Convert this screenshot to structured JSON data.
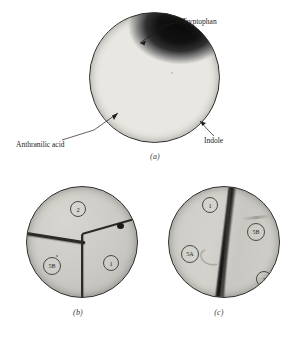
{
  "figure": {
    "panels": [
      {
        "id": "a",
        "caption": "(a)",
        "annotations": [
          {
            "name": "tryptophan",
            "label_prefix": "L",
            "label_rest": "-Tryptophan"
          },
          {
            "name": "anthranilic-acid",
            "label": "Anthranilic acid"
          },
          {
            "name": "indole",
            "label": "Indole"
          }
        ]
      },
      {
        "id": "b",
        "caption": "(b)",
        "tags": [
          {
            "name": "sector-2",
            "text": "2"
          },
          {
            "name": "sector-5b",
            "text": "5B"
          },
          {
            "name": "sector-1",
            "text": "1"
          }
        ]
      },
      {
        "id": "c",
        "caption": "(c)",
        "tags": [
          {
            "name": "sector-1",
            "text": "1"
          },
          {
            "name": "sector-5b",
            "text": "5B"
          },
          {
            "name": "sector-5a",
            "text": "5A"
          },
          {
            "name": "sector-2",
            "text": "2"
          }
        ]
      }
    ]
  },
  "colors": {
    "page_background": "#ffffff",
    "dish_outline": "#2b2b2b",
    "colony_dark": "#0a0a0a",
    "agar_light": "#f3f2ed",
    "agar_grey": "#cdcbc5",
    "label_text": "#1d1d1d"
  }
}
